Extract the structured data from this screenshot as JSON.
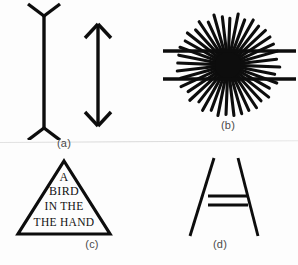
{
  "figure": {
    "background_color": "#fdfdfd",
    "ink_color": "#0d0d0d",
    "label_color": "#4a4a4a",
    "divider_color": "#e0e0e0"
  },
  "panels": [
    {
      "id": "a",
      "label": "(a)",
      "name": "muller-lyer-illusion",
      "description": "Two vertical shafts of equal length; left shaft has outward-splayed fins, right shaft has inward arrowheads",
      "shapes": {
        "left_shaft": {
          "x": 44,
          "y_top": 16,
          "y_bottom": 128
        },
        "left_fin_top": {
          "spread": 16,
          "height": 12,
          "direction": "outward"
        },
        "left_fin_bottom": {
          "spread": 16,
          "height": 12,
          "direction": "outward"
        },
        "right_shaft": {
          "x": 98,
          "y_top": 24,
          "y_bottom": 126
        },
        "right_head_top": {
          "spread": 13,
          "height": 14,
          "direction": "inward"
        },
        "right_head_bottom": {
          "spread": 13,
          "height": 14,
          "direction": "inward"
        },
        "stroke_width": 3.4
      }
    },
    {
      "id": "b",
      "label": "(b)",
      "name": "hering-illusion",
      "description": "Radiating sunburst of straight rays from a dense black center, overlaid by two long horizontal lines",
      "shapes": {
        "center": {
          "cx": 228,
          "cy": 65
        },
        "ray_count": 40,
        "ray_inner_radius": 4,
        "ray_outer_radius": 52,
        "ray_stroke_width": 3.1,
        "core_radius": 13,
        "horizontal_lines": [
          {
            "x1": 163,
            "x2": 296,
            "y": 51
          },
          {
            "x1": 163,
            "x2": 296,
            "y": 79
          }
        ],
        "horizontal_stroke_width": 3.4
      }
    },
    {
      "id": "c",
      "label": "(c)",
      "name": "proofreading-triangle-illusion",
      "description": "Equilateral triangle containing a repeated-word sentence",
      "text_lines": [
        "A",
        "BIRD",
        "IN THE",
        "THE HAND"
      ],
      "shapes": {
        "apex": {
          "x": 64,
          "y": 161
        },
        "left_base": {
          "x": 18,
          "y": 234
        },
        "right_base": {
          "x": 110,
          "y": 234
        },
        "stroke_width": 3.2
      }
    },
    {
      "id": "d",
      "label": "(d)",
      "name": "ponzo-illusion",
      "description": "Two converging oblique lines with two equal horizontal bars between them",
      "shapes": {
        "left_line": {
          "x1": 214,
          "y1": 158,
          "x2": 190,
          "y2": 236
        },
        "right_line": {
          "x1": 238,
          "y1": 158,
          "x2": 258,
          "y2": 236
        },
        "oblique_stroke_width": 2.9,
        "bars": [
          {
            "x1": 208,
            "x2": 248,
            "y": 196
          },
          {
            "x1": 208,
            "x2": 248,
            "y": 205
          }
        ],
        "bar_stroke_width": 3.0
      }
    }
  ]
}
